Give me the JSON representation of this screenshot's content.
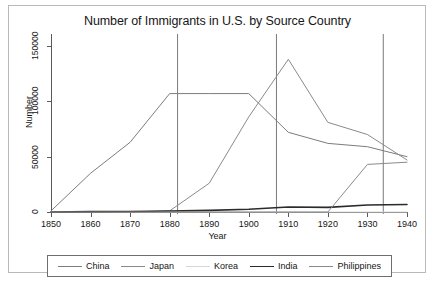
{
  "chart_data": {
    "type": "line",
    "title": "Number of Immigrants in U.S. by Source Country",
    "xlabel": "Year",
    "ylabel": "Number",
    "xlim": [
      1850,
      1940
    ],
    "ylim": [
      0,
      150000
    ],
    "xticks": [
      1850,
      1860,
      1870,
      1880,
      1890,
      1900,
      1910,
      1920,
      1930,
      1940
    ],
    "yticks": [
      0,
      50000,
      100000,
      150000
    ],
    "ytick_labels": [
      "0",
      "50000",
      "100000",
      "150000"
    ],
    "grid": false,
    "legend_position": "below",
    "x": [
      1850,
      1860,
      1870,
      1880,
      1890,
      1900,
      1910,
      1920,
      1930,
      1940
    ],
    "series": [
      {
        "name": "China",
        "color": "#7c7c7c",
        "width": 1.0,
        "values": [
          1000,
          35000,
          63000,
          107000,
          107000,
          107000,
          72000,
          62000,
          59000,
          50000
        ]
      },
      {
        "name": "Japan",
        "color": "#8a8a8a",
        "width": 1.0,
        "values": [
          0,
          0,
          0,
          1000,
          26000,
          86000,
          138000,
          81000,
          70000,
          47000
        ]
      },
      {
        "name": "Korea",
        "color": "#d8d8d8",
        "width": 1.0,
        "values": [
          0,
          0,
          0,
          0,
          0,
          0,
          0,
          0,
          0,
          0
        ]
      },
      {
        "name": "India",
        "color": "#2b2b2b",
        "width": 1.6,
        "values": [
          0,
          300,
          500,
          900,
          1500,
          2500,
          4500,
          4200,
          6300,
          6800
        ]
      },
      {
        "name": "Philippines",
        "color": "#8a8a8a",
        "width": 1.0,
        "values": [
          0,
          0,
          0,
          0,
          0,
          0,
          0,
          0,
          43000,
          45000
        ]
      }
    ],
    "reference_lines": [
      {
        "name": "reference-line-1882",
        "x": 1882
      },
      {
        "name": "reference-line-1907",
        "x": 1907
      },
      {
        "name": "reference-line-1934",
        "x": 1934
      }
    ],
    "reference_line_color": "#6b6b6b"
  },
  "legend": {
    "entries": [
      {
        "label": "China"
      },
      {
        "label": "Japan"
      },
      {
        "label": "Korea"
      },
      {
        "label": "India"
      },
      {
        "label": "Philippines"
      }
    ]
  }
}
